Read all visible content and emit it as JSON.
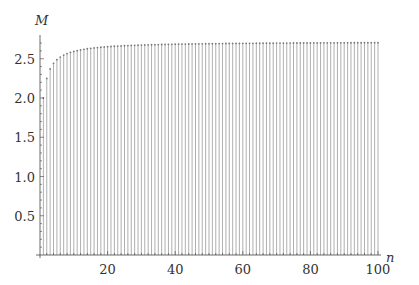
{
  "chart_data": {
    "type": "stem",
    "title": "",
    "xlabel": "n",
    "ylabel": "M",
    "xlim": [
      0,
      100
    ],
    "ylim": [
      0,
      2.75
    ],
    "x_ticks": [
      20,
      40,
      60,
      80,
      100
    ],
    "x_tick_labels": [
      "20",
      "40",
      "60",
      "80",
      "100"
    ],
    "y_ticks": [
      0.5,
      1.0,
      1.5,
      2.0,
      2.5
    ],
    "y_tick_labels": [
      "0.5",
      "1.0",
      "1.5",
      "2.0",
      "2.5"
    ],
    "grid": false,
    "legend": null,
    "series": [
      {
        "name": "M(n) = (1 + 1/n)^n",
        "formula": "(1+1/n)^n",
        "x_range": [
          1,
          100
        ],
        "sample_values": [
          {
            "n": 1,
            "M": 2.0
          },
          {
            "n": 2,
            "M": 2.25
          },
          {
            "n": 3,
            "M": 2.37
          },
          {
            "n": 4,
            "M": 2.441
          },
          {
            "n": 5,
            "M": 2.488
          },
          {
            "n": 10,
            "M": 2.594
          },
          {
            "n": 20,
            "M": 2.653
          },
          {
            "n": 50,
            "M": 2.692
          },
          {
            "n": 100,
            "M": 2.705
          }
        ]
      }
    ],
    "colors": {
      "stem": "#9a9a9a",
      "axis": "#444444",
      "text": "#333333"
    }
  }
}
